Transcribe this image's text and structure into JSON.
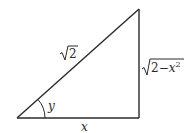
{
  "diagram": {
    "type": "right-triangle",
    "colors": {
      "stroke": "#2a2a2a",
      "background": "#ffffff"
    },
    "vertices": {
      "bottom_left": [
        17,
        118
      ],
      "bottom_right": [
        139,
        118
      ],
      "top_right": [
        139,
        9
      ]
    },
    "labels": {
      "hypotenuse_radicand": "2",
      "vertical_side_radicand": "2−",
      "vertical_side_var": "x",
      "vertical_side_exp": "2",
      "base": "x",
      "angle": "y"
    }
  }
}
